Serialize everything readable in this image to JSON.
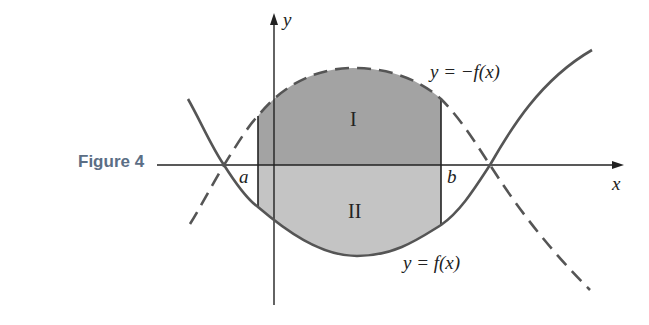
{
  "figure": {
    "label": "Figure 4",
    "axes": {
      "x_label": "x",
      "y_label": "y"
    },
    "curves": {
      "upper": "y = −f(x)",
      "lower": "y = f(x)"
    },
    "points": {
      "a": "a",
      "b": "b"
    },
    "regions": {
      "upper": "I",
      "lower": "II"
    },
    "colors": {
      "region_I": "#a3a3a3",
      "region_II": "#c4c4c4",
      "curve": "#555555",
      "figure_label": "#5b6e85"
    }
  }
}
